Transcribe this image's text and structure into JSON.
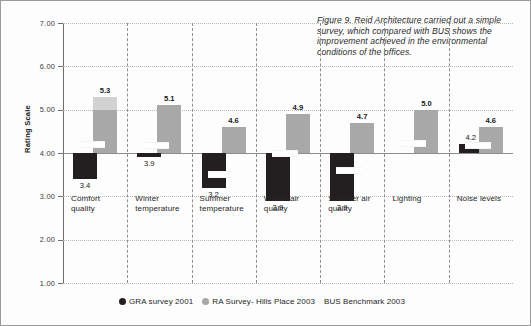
{
  "caption": "Figure 9. Reid Architecture carried out a simple survey, which compared with BUS shows the improvement achieved in the environmental conditions of the offices.",
  "legend": [
    {
      "marker": "circle-black",
      "label": "GRA survey 2001"
    },
    {
      "marker": "circle-gray",
      "label": "RA Survey- Hills Place 2003"
    },
    {
      "marker": "none",
      "label": "BUS Benchmark 2003"
    }
  ],
  "chart_data": {
    "type": "bar",
    "title": "",
    "xlabel": "",
    "ylabel": "Rating Scale",
    "ylim": [
      1.0,
      7.0
    ],
    "ytick_labels": [
      "7.00",
      "6.00",
      "5.00",
      "4.00",
      "3.00",
      "2.00",
      "1.00"
    ],
    "ytick_values": [
      7.0,
      6.0,
      5.0,
      4.0,
      3.0,
      2.0,
      1.0
    ],
    "baseline": 4.0,
    "grid": true,
    "legend_position": "bottom-center",
    "categories": [
      "Comfort quality",
      "Winter temperature",
      "Summer temperature",
      "Winter air quality",
      "Summer air quality",
      "Lighting",
      "Noise levels"
    ],
    "series": [
      {
        "name": "GRA survey 2001",
        "color": "#231f20",
        "values": [
          3.4,
          3.9,
          3.2,
          2.9,
          2.9,
          null,
          4.2
        ],
        "labels": [
          "3.4",
          "3.9",
          "3.2",
          "2.9",
          "2.9",
          "",
          "4.2"
        ]
      },
      {
        "name": "RA Survey- Hills Place 2003",
        "color": "#a8a8a8",
        "values": [
          5.3,
          5.1,
          4.6,
          4.9,
          4.7,
          5.0,
          4.6
        ],
        "labels": [
          "5.3",
          "5.1",
          "4.6",
          "4.9",
          "4.7",
          "5.0",
          "4.6"
        ]
      },
      {
        "name": "BUS Benchmark 2003",
        "color": "#ffffff",
        "values": [
          4.22,
          4.2,
          3.55,
          4.02,
          3.62,
          4.25,
          4.2
        ],
        "labels": [
          "",
          "",
          "",
          "",
          "",
          "",
          ""
        ]
      }
    ]
  }
}
